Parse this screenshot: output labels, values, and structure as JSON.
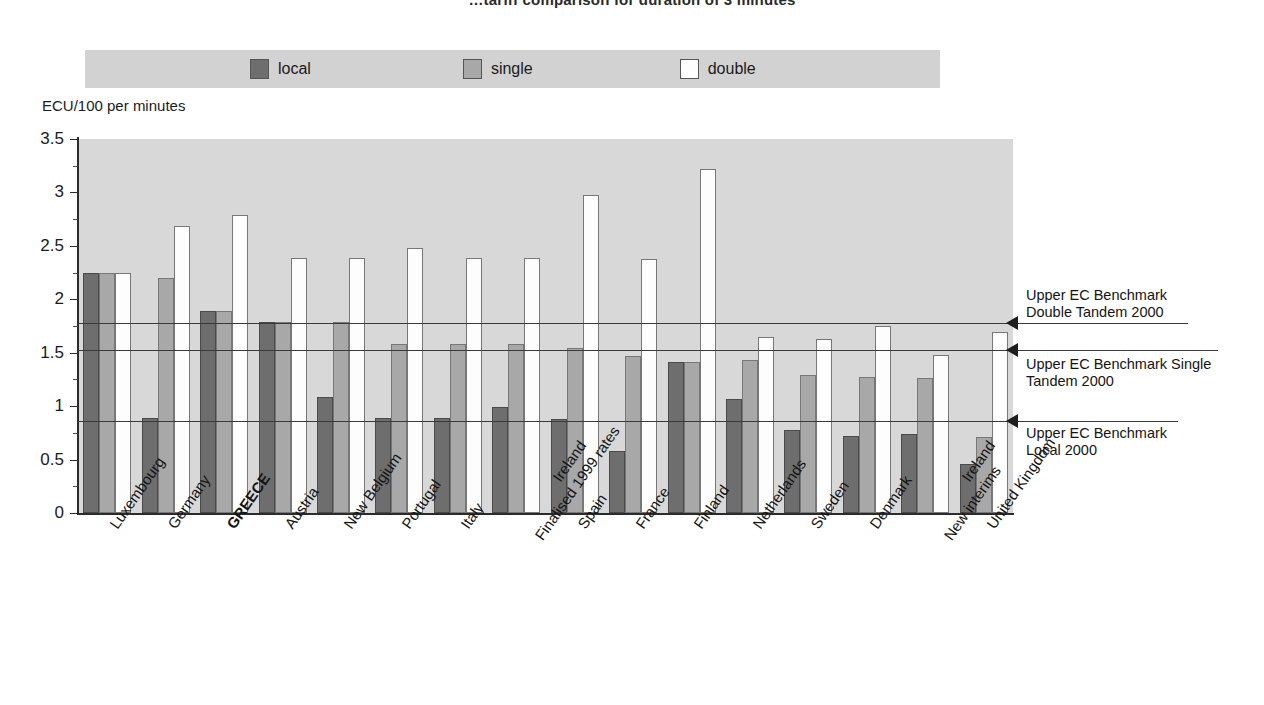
{
  "title": "…tariff comparison for duration of 3 minutes",
  "legend": {
    "items": [
      {
        "label": "local",
        "color": "#6e6e6e",
        "name": "legend-swatch-local"
      },
      {
        "label": "single",
        "color": "#a8a8a8",
        "name": "legend-swatch-single"
      },
      {
        "label": "double",
        "color": "#fdfdfd",
        "name": "legend-swatch-double"
      }
    ]
  },
  "y_axis_caption": "ECU/100 per minutes",
  "benchmarks": [
    {
      "id": "double-tandem",
      "value": 1.78,
      "label_line1": "Upper EC Benchmark",
      "label_line2": "Double Tandem 2000"
    },
    {
      "id": "single-tandem",
      "value": 1.53,
      "label_line1": "Upper EC Benchmark Single",
      "label_line2": "Tandem 2000"
    },
    {
      "id": "local",
      "value": 0.86,
      "label_line1": "Upper EC Benchmark",
      "label_line2": "Local 2000"
    }
  ],
  "chart_data": {
    "type": "bar",
    "title": "…tariff comparison for duration of 3 minutes",
    "xlabel": "",
    "ylabel": "ECU/100 per minutes",
    "ylim": [
      0,
      3.5
    ],
    "yticks": [
      "0",
      "0.5",
      "1",
      "1.5",
      "2",
      "2.5",
      "3",
      "3.5"
    ],
    "grid": false,
    "legend_position": "top",
    "categories": [
      "Luxembourg",
      "Germany",
      "GREECE",
      "Austria",
      "New Belgium",
      "Portugal",
      "Italy",
      "Ireland Finalised 1999 rates",
      "Spain",
      "France",
      "Finland",
      "Netherlands",
      "Sweden",
      "Denmark",
      "Ireland New interims",
      "United Kingdom"
    ],
    "category_lines": [
      [
        "Luxembourg"
      ],
      [
        "Germany"
      ],
      [
        "GREECE"
      ],
      [
        "Austria"
      ],
      [
        "New Belgium"
      ],
      [
        "Portugal"
      ],
      [
        "Italy"
      ],
      [
        "Ireland",
        "Finalised 1999 rates"
      ],
      [
        "Spain"
      ],
      [
        "France"
      ],
      [
        "Finland"
      ],
      [
        "Netherlands"
      ],
      [
        "Sweden"
      ],
      [
        "Denmark"
      ],
      [
        "Ireland",
        "New interims"
      ],
      [
        "United Kingdom"
      ]
    ],
    "highlight_category": "GREECE",
    "series": [
      {
        "name": "local",
        "color": "#6e6e6e",
        "values": [
          2.25,
          0.89,
          1.89,
          1.79,
          1.09,
          0.89,
          0.89,
          0.99,
          0.88,
          0.58,
          1.41,
          1.07,
          0.78,
          0.72,
          0.74,
          0.46
        ]
      },
      {
        "name": "single",
        "color": "#a8a8a8",
        "values": [
          2.25,
          2.2,
          1.89,
          1.79,
          1.79,
          1.58,
          1.58,
          1.58,
          1.54,
          1.47,
          1.41,
          1.43,
          1.29,
          1.27,
          1.26,
          0.71
        ]
      },
      {
        "name": "double",
        "color": "#fdfdfd",
        "values": [
          2.25,
          2.69,
          2.79,
          2.39,
          2.39,
          2.48,
          2.39,
          2.39,
          2.98,
          2.38,
          3.22,
          1.65,
          1.63,
          1.75,
          1.48,
          1.69
        ]
      }
    ],
    "benchmark_lines": [
      {
        "name": "Upper EC Benchmark Double Tandem 2000",
        "value": 1.78
      },
      {
        "name": "Upper EC Benchmark Single Tandem 2000",
        "value": 1.53
      },
      {
        "name": "Upper EC Benchmark Local 2000",
        "value": 0.86
      }
    ]
  }
}
